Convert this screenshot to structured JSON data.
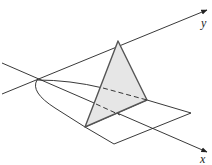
{
  "diagram": {
    "axes": {
      "x_label": "x",
      "y_label": "y"
    },
    "colors": {
      "stroke": "#222222",
      "triangle_fill": "#e6e6e6",
      "triangle_edge": "#555555"
    }
  }
}
